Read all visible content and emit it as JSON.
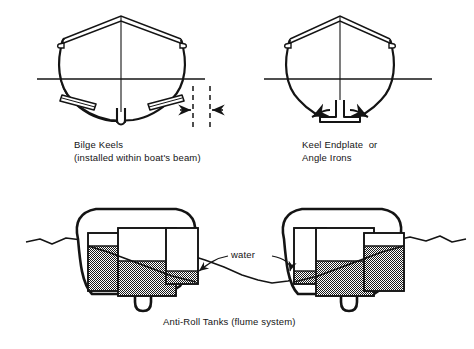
{
  "figure": {
    "background_color": "#ffffff",
    "ink_color": "#141414",
    "water_fill_color": "#808080"
  },
  "panels": [
    {
      "id": "bilge-keels",
      "caption_line1": "Bilge Keels",
      "caption_line2": "(installed within boat's beam)",
      "features": [
        "bow-view hull with peaked deck and gunwale rail",
        "waterline",
        "centerline",
        "port and starboard bilge keel fins",
        "central keel fin",
        "beam dimension arrows between dashed lines"
      ]
    },
    {
      "id": "keel-endplate",
      "caption_line1": "Keel Endplate  or",
      "caption_line2": "Angle Irons",
      "features": [
        "bow-view hull with peaked deck and gunwale rail",
        "waterline",
        "centerline",
        "keel with horizontal endplate",
        "outward curved flow arrows each side"
      ]
    },
    {
      "id": "anti-roll-tanks",
      "caption": "Anti-Roll Tanks (flume system)",
      "water_label": "water",
      "boats": [
        {
          "id": "left-boat",
          "heel": "water low to port",
          "tanks": [
            {
              "name": "port-tank",
              "fill_fraction": 0.78
            },
            {
              "name": "center-tank",
              "fill_fraction": 0.52
            },
            {
              "name": "starboard-tank",
              "fill_fraction": 0.24
            }
          ]
        },
        {
          "id": "right-boat",
          "heel": "water low to starboard",
          "tanks": [
            {
              "name": "port-tank",
              "fill_fraction": 0.24
            },
            {
              "name": "center-tank",
              "fill_fraction": 0.52
            },
            {
              "name": "starboard-tank",
              "fill_fraction": 0.78
            }
          ]
        }
      ]
    }
  ]
}
